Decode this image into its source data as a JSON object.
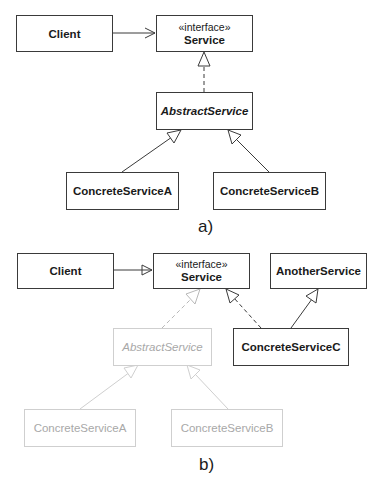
{
  "diagram_a": {
    "caption": "a)",
    "classes": {
      "client": {
        "name": "Client"
      },
      "service": {
        "stereotype": "«interface»",
        "name": "Service"
      },
      "abstract_service": {
        "name": "AbstractService",
        "abstract": true
      },
      "concrete_a": {
        "name": "ConcreteServiceA"
      },
      "concrete_b": {
        "name": "ConcreteServiceB"
      }
    },
    "relations": [
      {
        "from": "Client",
        "to": "Service",
        "type": "association"
      },
      {
        "from": "AbstractService",
        "to": "Service",
        "type": "realization"
      },
      {
        "from": "ConcreteServiceA",
        "to": "AbstractService",
        "type": "generalization"
      },
      {
        "from": "ConcreteServiceB",
        "to": "AbstractService",
        "type": "generalization"
      }
    ]
  },
  "diagram_b": {
    "caption": "b)",
    "classes": {
      "client": {
        "name": "Client"
      },
      "service": {
        "stereotype": "«interface»",
        "name": "Service"
      },
      "another_service": {
        "name": "AnotherService"
      },
      "abstract_service": {
        "name": "AbstractService",
        "abstract": true,
        "faded": true
      },
      "concrete_c": {
        "name": "ConcreteServiceC"
      },
      "concrete_a": {
        "name": "ConcreteServiceA",
        "faded": true
      },
      "concrete_b": {
        "name": "ConcreteServiceB",
        "faded": true
      }
    },
    "relations": [
      {
        "from": "Client",
        "to": "Service",
        "type": "association"
      },
      {
        "from": "AbstractService",
        "to": "Service",
        "type": "realization",
        "faded": true
      },
      {
        "from": "ConcreteServiceC",
        "to": "Service",
        "type": "realization"
      },
      {
        "from": "ConcreteServiceC",
        "to": "AnotherService",
        "type": "generalization"
      },
      {
        "from": "ConcreteServiceA",
        "to": "AbstractService",
        "type": "generalization",
        "faded": true
      },
      {
        "from": "ConcreteServiceB",
        "to": "AbstractService",
        "type": "generalization",
        "faded": true
      }
    ]
  },
  "colors": {
    "line": "#3a3a3a",
    "faded_line": "#cfcfcf",
    "faded_text": "#a8a8a8",
    "text": "#1a1a1a"
  }
}
